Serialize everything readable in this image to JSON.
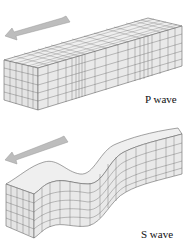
{
  "panels": [
    {
      "id": "p-wave",
      "label": "P wave",
      "description": "Compressional wave: grid lines bunched and spread along block",
      "arrow_direction": "left"
    },
    {
      "id": "s-wave",
      "label": "S wave",
      "description": "Shear wave: block deformed into up-down undulation",
      "arrow_direction": "left"
    }
  ],
  "colors": {
    "arrow": "#b8b8b8",
    "block_front": "#e6e6e6",
    "block_top": "#efefef",
    "block_side": "#d8d8d8",
    "grid": "#555555"
  }
}
